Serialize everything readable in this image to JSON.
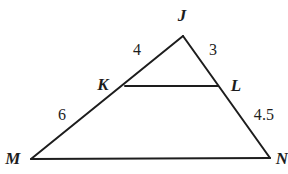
{
  "figure": {
    "kind": "geometry-diagram",
    "background_color": "#ffffff",
    "stroke_color": "#1d1d1d",
    "stroke_width": 2,
    "canvas": {
      "width": 288,
      "height": 174
    }
  },
  "vertices": [
    {
      "id": "J",
      "label": "J",
      "point_x": 183,
      "point_y": 36,
      "label_x": 182,
      "label_y": 15
    },
    {
      "id": "K",
      "label": "K",
      "point_x": 125,
      "point_y": 86,
      "label_x": 103,
      "label_y": 84
    },
    {
      "id": "L",
      "label": "L",
      "point_x": 218,
      "point_y": 86,
      "label_x": 236,
      "label_y": 85
    },
    {
      "id": "M",
      "label": "M",
      "point_x": 31,
      "point_y": 159,
      "label_x": 13,
      "label_y": 158
    },
    {
      "id": "N",
      "label": "N",
      "point_x": 270,
      "point_y": 158,
      "label_x": 282,
      "label_y": 158
    }
  ],
  "segments": [
    {
      "id": "JM",
      "from": "J",
      "to": "M",
      "x1": 183,
      "y1": 36,
      "x2": 31,
      "y2": 159
    },
    {
      "id": "JN",
      "from": "J",
      "to": "N",
      "x1": 183,
      "y1": 36,
      "x2": 270,
      "y2": 158
    },
    {
      "id": "MN",
      "from": "M",
      "to": "N",
      "x1": 31,
      "y1": 159,
      "x2": 270,
      "y2": 158
    },
    {
      "id": "KL",
      "from": "K",
      "to": "L",
      "x1": 125,
      "y1": 86,
      "x2": 218,
      "y2": 86
    }
  ],
  "measurements": [
    {
      "id": "JK",
      "value": "4",
      "on_segment": "JM",
      "label_x": 137,
      "label_y": 50
    },
    {
      "id": "JL",
      "value": "3",
      "on_segment": "JN",
      "label_x": 213,
      "label_y": 50
    },
    {
      "id": "KM",
      "value": "6",
      "on_segment": "JM",
      "label_x": 62,
      "label_y": 115
    },
    {
      "id": "LN",
      "value": "4.5",
      "on_segment": "JN",
      "label_x": 264,
      "label_y": 115
    }
  ]
}
